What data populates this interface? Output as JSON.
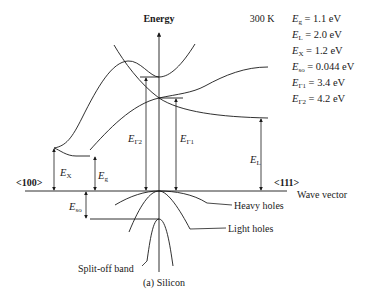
{
  "figure": {
    "axis_energy_label": "Energy",
    "temperature_label": "300 K",
    "x_axis_label": "Wave vector",
    "direction_left": "<100>",
    "direction_right": "<111>",
    "caption": "(a) Silicon"
  },
  "legend": [
    {
      "sym": "E",
      "sub": "g",
      "value": " = 1.1 eV"
    },
    {
      "sym": "E",
      "sub": "L",
      "value": " = 2.0 eV"
    },
    {
      "sym": "E",
      "sub": "X",
      "value": " = 1.2 eV"
    },
    {
      "sym": "E",
      "sub": "so",
      "value": " = 0.044 eV"
    },
    {
      "sym": "E",
      "sub": "Γ1",
      "value": " = 3.4 eV"
    },
    {
      "sym": "E",
      "sub": "Γ2",
      "value": " = 4.2 eV"
    }
  ],
  "gap_labels": {
    "gamma2": {
      "sym": "E",
      "sub": "Γ2"
    },
    "gamma1": {
      "sym": "E",
      "sub": "Γ1"
    },
    "L": {
      "sym": "E",
      "sub": "L"
    },
    "X": {
      "sym": "E",
      "sub": "X"
    },
    "g": {
      "sym": "E",
      "sub": "g"
    },
    "so": {
      "sym": "E",
      "sub": "so"
    }
  },
  "band_labels": {
    "heavy_holes": "Heavy holes",
    "light_holes": "Light holes",
    "split_off": "Split-off band"
  },
  "colors": {
    "ink": "#1a1a1a",
    "background": "#ffffff"
  }
}
